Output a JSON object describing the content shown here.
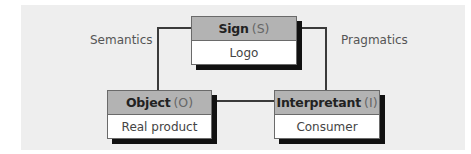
{
  "diagram": {
    "nodes": {
      "sign": {
        "name": "Sign",
        "abbr": "(S)",
        "value": "Logo"
      },
      "object": {
        "name": "Object",
        "abbr": "(O)",
        "value": "Real product"
      },
      "interpretant": {
        "name": "Interpretant",
        "abbr": "(I)",
        "value": "Consumer"
      }
    },
    "edges": [
      {
        "from": "sign",
        "to": "object",
        "label": "Semantics"
      },
      {
        "from": "sign",
        "to": "interpretant",
        "label": "Pragmatics"
      },
      {
        "from": "object",
        "to": "interpretant",
        "label": ""
      }
    ],
    "labels": {
      "semantics": "Semantics",
      "pragmatics": "Pragmatics"
    },
    "colors": {
      "panel_bg": "#eeeeee",
      "header_fill": "#b3b3b3",
      "shadow": "#111111",
      "line": "#3a3a3a"
    }
  }
}
